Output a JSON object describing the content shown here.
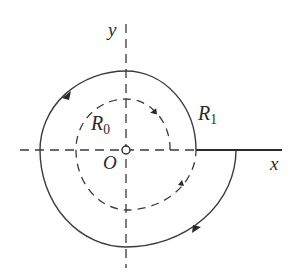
{
  "diagram": {
    "labels": {
      "y_axis": "y",
      "x_axis": "x",
      "origin": "O",
      "inner_radius": {
        "base": "R",
        "sub": "0"
      },
      "outer_radius": {
        "base": "R",
        "sub": "1"
      }
    },
    "colors": {
      "stroke": "#3a3a3a",
      "background": "#ffffff"
    },
    "elements": [
      "dashed y-axis through origin",
      "dashed x-axis (left of R1 crossing), solid x-axis (right of crossing)",
      "small open circle at origin",
      "dashed inner spiral starting near R0 with counterclockwise arrows",
      "solid outer spiral starting near R1 with counterclockwise arrows"
    ]
  }
}
